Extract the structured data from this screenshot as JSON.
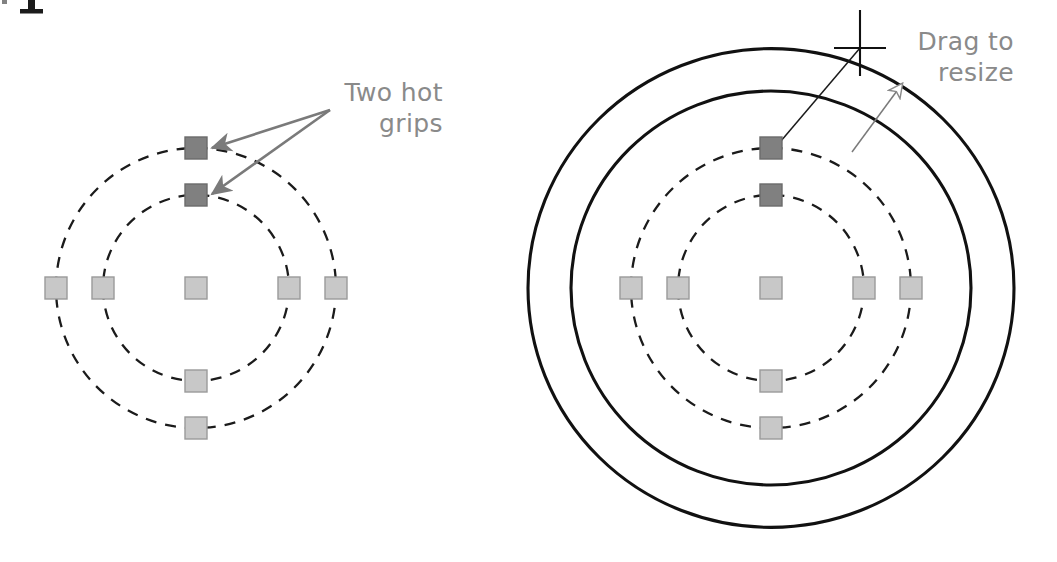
{
  "figure": {
    "title_fragment": "p",
    "background_color": "#ffffff",
    "panels": [
      {
        "id": "before",
        "name": "grips-selected-state",
        "center": {
          "x": 196,
          "y": 288
        },
        "center_grip": {
          "state": "cold"
        },
        "dashed_circles": [
          {
            "radius": 93,
            "name": "inner-circle",
            "style": "dashed"
          },
          {
            "radius": 140,
            "name": "outer-circle",
            "style": "dashed"
          }
        ],
        "solid_preview_circles": [],
        "grips": [
          {
            "circle": "inner",
            "position": "north",
            "state": "hot"
          },
          {
            "circle": "outer",
            "position": "north",
            "state": "hot"
          },
          {
            "circle": "inner",
            "position": "south",
            "state": "cold"
          },
          {
            "circle": "outer",
            "position": "south",
            "state": "cold"
          },
          {
            "circle": "inner",
            "position": "west",
            "state": "cold"
          },
          {
            "circle": "outer",
            "position": "west",
            "state": "cold"
          },
          {
            "circle": "inner",
            "position": "east",
            "state": "cold"
          },
          {
            "circle": "outer",
            "position": "east",
            "state": "cold"
          }
        ],
        "annotation": {
          "lines": [
            "Two hot",
            "grips"
          ],
          "text_anchor": {
            "x": 443,
            "y": 101
          },
          "arrow_origin": {
            "x": 330,
            "y": 110
          },
          "arrow_targets": [
            {
              "x": 212,
              "y": 148
            },
            {
              "x": 212,
              "y": 194
            }
          ],
          "arrow_style": "solid-filled"
        },
        "cursor": null
      },
      {
        "id": "after",
        "name": "grips-drag-resize-preview",
        "center": {
          "x": 771,
          "y": 288
        },
        "center_grip": {
          "state": "cold"
        },
        "dashed_circles": [
          {
            "radius": 93,
            "name": "inner-circle",
            "style": "dashed"
          },
          {
            "radius": 140,
            "name": "outer-circle",
            "style": "dashed"
          }
        ],
        "solid_preview_circles": [
          {
            "radius": 200,
            "name": "inner-preview-circle",
            "style": "solid"
          },
          {
            "radius": 243,
            "name": "outer-preview-circle",
            "style": "solid"
          }
        ],
        "grips": [
          {
            "circle": "inner",
            "position": "north",
            "state": "hot"
          },
          {
            "circle": "outer",
            "position": "north",
            "state": "hot"
          },
          {
            "circle": "inner",
            "position": "south",
            "state": "cold"
          },
          {
            "circle": "outer",
            "position": "south",
            "state": "cold"
          },
          {
            "circle": "inner",
            "position": "west",
            "state": "cold"
          },
          {
            "circle": "outer",
            "position": "west",
            "state": "cold"
          },
          {
            "circle": "inner",
            "position": "east",
            "state": "cold"
          },
          {
            "circle": "outer",
            "position": "east",
            "state": "cold"
          }
        ],
        "annotation": {
          "lines": [
            "Drag to",
            "resize"
          ],
          "text_anchor": {
            "x": 1014,
            "y": 50
          },
          "arrow_origin": {
            "x": 852,
            "y": 152
          },
          "arrow_targets": [
            {
              "x": 902,
              "y": 84
            }
          ],
          "arrow_style": "outline"
        },
        "cursor": {
          "type": "crosshair",
          "x": 860,
          "y": 48,
          "arm_length": 26,
          "leader_to": {
            "x": 775,
            "y": 148
          }
        }
      }
    ],
    "colors": {
      "hot_grip_fill": "#808080",
      "hot_grip_stroke": "#6b6b6b",
      "cold_grip_fill": "#c8c8c8",
      "cold_grip_stroke": "#9a9a9a",
      "dashed_circle": "#1b1b1b",
      "solid_circle": "#111111",
      "annotation_text": "#8a8a8a",
      "annotation_arrow": "#7a7a7a",
      "cursor": "#111111",
      "leader_line": "#1b1b1b"
    },
    "grip_size": 22
  }
}
